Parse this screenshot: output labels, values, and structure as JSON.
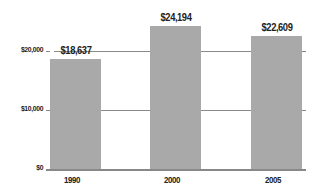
{
  "chart_data": {
    "type": "bar",
    "title": "",
    "xlabel": "",
    "ylabel": "",
    "categories": [
      "1990",
      "2000",
      "2005"
    ],
    "values": [
      18637,
      24194,
      22609
    ],
    "value_labels": [
      "$18,637",
      "$24,194",
      "$22,609"
    ],
    "ylim": [
      0,
      25000
    ],
    "yticks": [
      0,
      10000,
      20000
    ],
    "ytick_labels": [
      "$0",
      "$10,000",
      "$20,000"
    ],
    "grid": true,
    "legend": null,
    "colors": {
      "bar": "#a9a9a9",
      "grid": "#8a8a8a",
      "text": "#222222"
    }
  }
}
